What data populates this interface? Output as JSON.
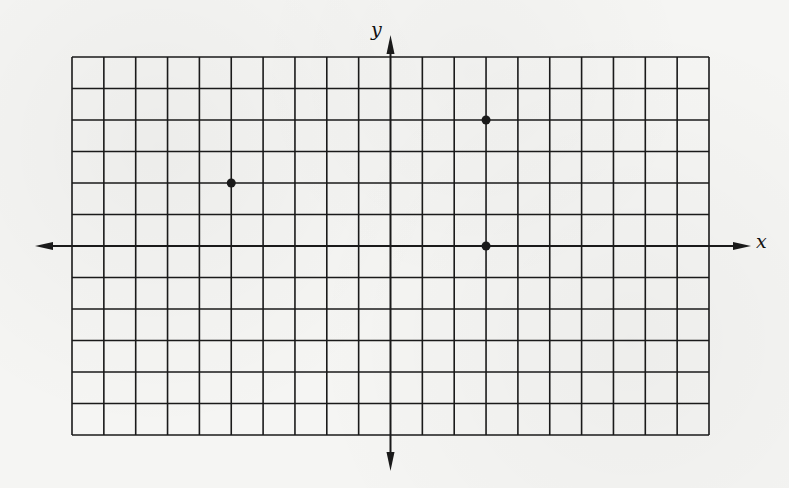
{
  "chart_data": {
    "type": "scatter",
    "title": "",
    "xlabel": "x",
    "ylabel": "y",
    "grid": true,
    "xlim": [
      -10,
      10
    ],
    "ylim": [
      -6,
      6
    ],
    "grid_step": 1,
    "tick_labels": false,
    "legend": null,
    "points": [
      {
        "x": -5,
        "y": 2
      },
      {
        "x": 3,
        "y": 4
      },
      {
        "x": 3,
        "y": 0
      }
    ]
  },
  "colors": {
    "ink": "#1a1a1a",
    "paper": "#f5f5f3"
  },
  "labels": {
    "x_axis": "x",
    "y_axis": "y"
  }
}
